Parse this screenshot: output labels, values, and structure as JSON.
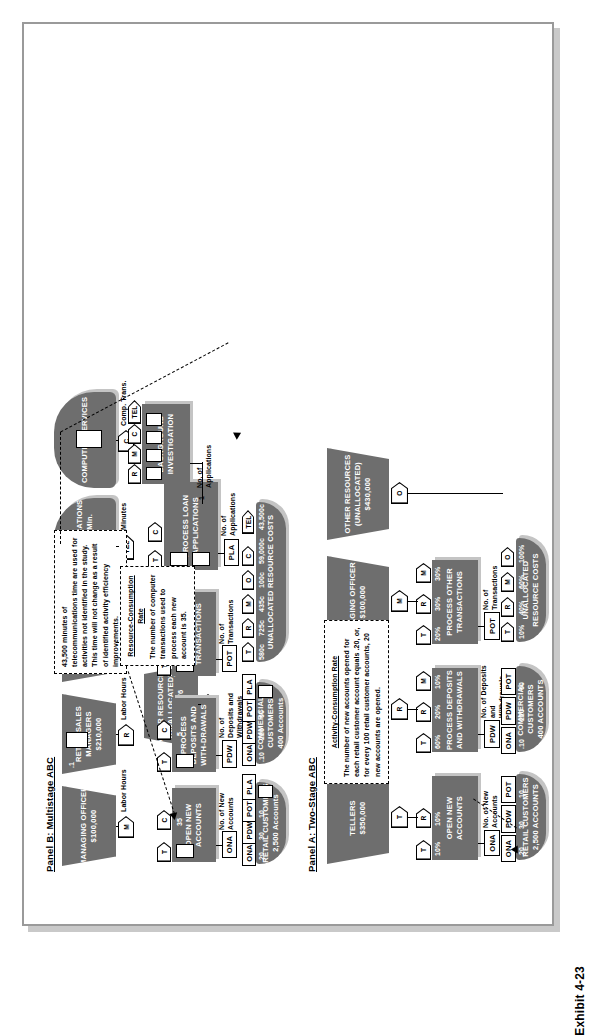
{
  "exhibit": {
    "label": "Exhibit 4-23"
  },
  "panel_a": {
    "title": "Panel A: Two-Stage ABC",
    "resources": [
      {
        "name": "TELLERS",
        "amount": "$350,000",
        "tag": "T"
      },
      {
        "name": "RETAIL SALES MANAGERS",
        "amount": "$210,000",
        "tag": "R"
      },
      {
        "name": "MANAGING OFFICER",
        "amount": "$100,000",
        "tag": "M"
      },
      {
        "name": "OTHER RESOURCES",
        "qualifier": "(UNALLOCATED)",
        "amount": "$430,000",
        "tag": "O"
      }
    ],
    "activities": [
      {
        "name": "OPEN NEW ACCOUNTS",
        "drivers": [
          {
            "tag": "T",
            "pct": "10%"
          },
          {
            "tag": "R",
            "pct": "10%"
          }
        ],
        "output_tag": "ONA",
        "output_label": "No. of New Accounts"
      },
      {
        "name": "PROCESS DEPOSITS AND WITHDRAWALS",
        "drivers": [
          {
            "tag": "T",
            "pct": "60%"
          },
          {
            "tag": "R",
            "pct": "20%"
          },
          {
            "tag": "M",
            "pct": "10%"
          }
        ],
        "output_tag": "PDW",
        "output_label": "No. of Deposits and Withdrawals"
      },
      {
        "name": "PROCESS OTHER TRANSACTIONS",
        "drivers": [
          {
            "tag": "T",
            "pct": "20%"
          },
          {
            "tag": "R",
            "pct": "30%"
          },
          {
            "tag": "M",
            "pct": "30%"
          }
        ],
        "output_tag": "POT",
        "output_label": "No. of Transactions"
      }
    ],
    "cost_objects": [
      {
        "name": "RETAIL CUSTOMERS",
        "detail": "2,500 ACCOUNTS",
        "drivers": [
          {
            "tag": "ONA",
            "value": ".20"
          },
          {
            "tag": "PDW",
            "value": "30"
          },
          {
            "tag": "POT",
            "value": "10"
          }
        ]
      },
      {
        "name": "COMMERCIAL CUSTOMERS",
        "detail": "400 ACCOUNTS",
        "drivers": [
          {
            "tag": "ONA",
            "value": ".10"
          },
          {
            "tag": "PDW",
            "value": "220"
          },
          {
            "tag": "POT",
            "value": "60"
          }
        ]
      },
      {
        "name": "UNALLOCATED RESOURCE COSTS",
        "detail": "",
        "drivers": [
          {
            "tag": "T",
            "value": "10%"
          },
          {
            "tag": "R",
            "value": "40%"
          },
          {
            "tag": "M",
            "value": "60%"
          },
          {
            "tag": "O",
            "value": "100%"
          }
        ]
      }
    ],
    "note": {
      "title": "Activity-Consumption Rate",
      "body": "The number of new accounts opened for each retail customer account equals .20, or, for every 100 retail customer accounts, 20 new accounts are opened."
    }
  },
  "panel_b": {
    "title": "Panel B: Multistage ABC",
    "resources": [
      {
        "name": "MANAGING OFFICER",
        "amount": "$100,000",
        "tag": "M",
        "driver_label": "Labor Hours"
      },
      {
        "name": "RETAIL SALES MANAGERS",
        "amount": "$210,000",
        "tag": "R",
        "driver_label": "Labor Hours"
      },
      {
        "name": "TELLERS",
        "amount": "$350,000",
        "tag": "T",
        "driver_label": "Labor Hours"
      },
      {
        "name": "TELECOMMUNICATIONS",
        "amount": "$.175080436/Min.",
        "tag": "TEL",
        "driver_label": "Minutes"
      },
      {
        "name": "COMPUTER SERVICES",
        "amount": "",
        "tag": "C",
        "driver_label": "Comp. Trans."
      },
      {
        "name": "OTHER RESOURCES",
        "qualifier": "(UNALLOCATED)",
        "amount": "$303,076",
        "tag": "O",
        "driver_label": ""
      }
    ],
    "inter_resource": [
      {
        "from": "M",
        "to": "R",
        "value": ".1"
      }
    ],
    "activities": [
      {
        "name": "OPEN NEW ACCOUNTS",
        "drivers": [
          {
            "tag": "T",
            "value": ""
          },
          {
            "tag": "C",
            "value": "35"
          }
        ],
        "output_tag": "ONA",
        "output_label": "No. of New Accounts"
      },
      {
        "name": "PROCESS DEPOSITS AND WITH-DRAWALS",
        "drivers": [
          {
            "tag": "T",
            "value": ""
          },
          {
            "tag": "C",
            "value": "5"
          }
        ],
        "output_tag": "PDW",
        "output_label": "No. of Deposits and Withdrawals"
      },
      {
        "name": "PROCESS OTHER TRANSACTIONS",
        "drivers": [
          {
            "tag": "T",
            "value": ""
          },
          {
            "tag": "R",
            "value": ".02"
          },
          {
            "tag": "C",
            "value": "15"
          },
          {
            "tag": "TEL",
            "value": "4"
          }
        ],
        "output_tag": "POT",
        "output_label": "No. of Transactions"
      },
      {
        "name": "PROCESS LOAN APPLICATIONS",
        "drivers": [
          {
            "tag": "T",
            "value": ""
          },
          {
            "tag": "C",
            "value": ""
          }
        ],
        "output_tag": "PLA",
        "output_label": "No. of Applications"
      },
      {
        "name": "BACKGROUND INVESTIGATION",
        "drivers": [
          {
            "tag": "R",
            "value": ""
          },
          {
            "tag": "M",
            "value": ""
          },
          {
            "tag": "C",
            "value": ""
          },
          {
            "tag": "TEL",
            "value": ""
          }
        ],
        "output_tag": "",
        "output_label": "No. of Applications",
        "output_value": "1"
      }
    ],
    "cost_objects": [
      {
        "name": "RETAIL CUSTOMERS",
        "detail": "2,500 Accounts",
        "drivers": [
          {
            "tag": "ONA",
            "value": ".20"
          },
          {
            "tag": "PDW",
            "value": "30"
          },
          {
            "tag": "POT",
            "value": "10"
          },
          {
            "tag": "PLA",
            "value": ""
          }
        ]
      },
      {
        "name": "COMMERCIAL CUSTOMERS",
        "detail": "400 Accounts",
        "drivers": [
          {
            "tag": "ONA",
            "value": ".10"
          },
          {
            "tag": "PDW",
            "value": "220"
          },
          {
            "tag": "POT",
            "value": "60"
          },
          {
            "tag": "PLA",
            "value": ""
          }
        ]
      },
      {
        "name": "UNALLOCATED RESOURCE COSTS",
        "detail": "",
        "drivers": [
          {
            "tag": "T",
            "value": "580c"
          },
          {
            "tag": "R",
            "value": "725c"
          },
          {
            "tag": "M",
            "value": "435c"
          },
          {
            "tag": "O",
            "value": "100c"
          },
          {
            "tag": "C",
            "value": "59,000c"
          },
          {
            "tag": "TEL",
            "value": "43,500c"
          }
        ]
      }
    ],
    "notes": [
      {
        "title": "",
        "body": "43,500 minutes of telecommunications time are used for activities not identified in the study. This time will not change as a result of identified activity efficiency improvements."
      },
      {
        "title": "Resource-Consumption Rate",
        "body": "The number of computer transactions used to process each new account is 35."
      }
    ]
  }
}
